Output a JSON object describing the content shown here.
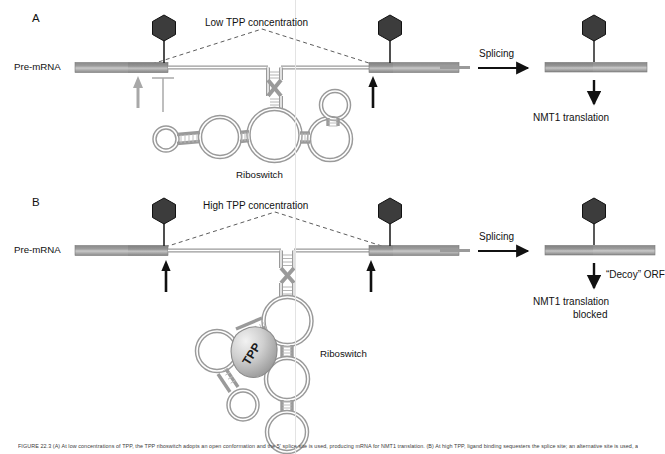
{
  "figure": {
    "caption": "FIGURE 22.3  (A) At low concentrations of TPP, the TPP riboswitch adopts an open conformation and the 5' splice site is used, producing mRNA for NMT1 translation. (B) At high TPP, ligand binding sequesters the splice site; an alternative site is used, adding a \"decoy\" ORF that blocks NMT1 translation.",
    "vertical_guide_color": "#e3e3e3",
    "rna_stroke_color": "#9a9a9a",
    "exon_color": "#8d8d8d",
    "hexagon_color": "#3a3a3a",
    "grey_arrow_color": "#a8a8a8",
    "black_arrow_color": "#111111"
  },
  "panels": [
    {
      "letter": "A",
      "premrna_label": "Pre-mRNA",
      "condition_label": "Low TPP concentration",
      "riboswitch_label": "Riboswitch",
      "splicing_label": "Splicing",
      "outcome_label": "NMT1 translation",
      "decoy_label": "",
      "left_site_marker": "grey-up-arrow",
      "left_block_marker": "grey-t-bar",
      "right_site_marker": "black-up-arrow",
      "cap_count": 2,
      "result_cap_count": 1
    },
    {
      "letter": "B",
      "premrna_label": "Pre-mRNA",
      "condition_label": "High TPP concentration",
      "riboswitch_label": "Riboswitch",
      "splicing_label": "Splicing",
      "outcome_label_line1": "NMT1 translation",
      "outcome_label_line2": "blocked",
      "decoy_label": "“Decoy” ORF",
      "ligand_label": "TPP",
      "left_site_marker": "black-up-arrow",
      "right_site_marker": "black-up-arrow",
      "cap_count": 2,
      "result_cap_count": 1
    }
  ]
}
